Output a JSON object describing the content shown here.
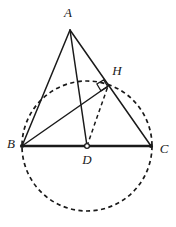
{
  "figure": {
    "width": 176,
    "height": 227,
    "background_color": "#ffffff",
    "stroke_color": "#1a1a1a"
  },
  "points": {
    "A": {
      "label": "A",
      "x": 70,
      "y": 30,
      "label_x": 68,
      "label_y": 14,
      "marker": "none"
    },
    "B": {
      "label": "B",
      "x": 22,
      "y": 146,
      "label_x": 11,
      "label_y": 145,
      "marker": "solid"
    },
    "C": {
      "label": "C",
      "x": 151,
      "y": 146,
      "label_x": 164,
      "label_y": 150,
      "marker": "solid"
    },
    "D": {
      "label": "D",
      "x": 87,
      "y": 146,
      "label_x": 87,
      "label_y": 161,
      "marker": "open"
    },
    "H": {
      "label": "H",
      "x": 108,
      "y": 86,
      "label_x": 117,
      "label_y": 72,
      "marker": "none"
    }
  },
  "segments": [
    {
      "name": "segment-AB",
      "from": "A",
      "to": "B",
      "style": "solid"
    },
    {
      "name": "segment-AC",
      "from": "A",
      "to": "C",
      "style": "solid"
    },
    {
      "name": "segment-BC",
      "from": "B",
      "to": "C",
      "style": "base"
    },
    {
      "name": "segment-AD",
      "from": "A",
      "to": "D",
      "style": "solid"
    },
    {
      "name": "segment-BH",
      "from": "B",
      "to": "H",
      "style": "solid"
    },
    {
      "name": "segment-DH",
      "from": "D",
      "to": "H",
      "style": "dashed"
    }
  ],
  "circle": {
    "name": "circumscribing-circle",
    "center": "D",
    "cx": 87,
    "cy": 146,
    "radius": 65,
    "style": "dashed"
  },
  "angle_marks": [
    {
      "name": "right-angle-at-H",
      "at": "H",
      "type": "right-angle",
      "size": 7
    }
  ]
}
